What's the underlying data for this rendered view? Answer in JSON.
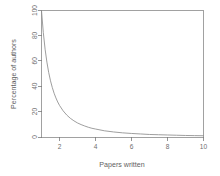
{
  "chart_data": {
    "type": "line",
    "title": "",
    "xlabel": "Papers written",
    "ylabel": "Percentage of authors",
    "xlim": [
      1,
      10
    ],
    "ylim": [
      0,
      100
    ],
    "xticks": [
      2,
      4,
      6,
      8,
      10
    ],
    "xtick_labels": [
      "2",
      "4",
      "6",
      "8",
      "10"
    ],
    "yticks": [
      0,
      20,
      40,
      60,
      80,
      100
    ],
    "ytick_labels": [
      "0",
      "20",
      "40",
      "60",
      "80",
      "100"
    ],
    "grid": false,
    "legend": false,
    "legend_position": "none",
    "frame": "box",
    "series": [
      {
        "name": "Lotka distribution",
        "x": [
          1.0,
          1.1,
          1.2,
          1.3,
          1.4,
          1.5,
          1.6,
          1.7,
          1.8,
          1.9,
          2.0,
          2.2,
          2.4,
          2.6,
          2.8,
          3.0,
          3.2,
          3.4,
          3.6,
          3.8,
          4.0,
          4.5,
          5.0,
          5.5,
          6.0,
          6.5,
          7.0,
          7.5,
          8.0,
          8.5,
          9.0,
          9.5,
          10.0
        ],
        "values": [
          100.0,
          82.6,
          69.4,
          59.2,
          51.0,
          44.4,
          39.1,
          34.6,
          30.9,
          27.7,
          25.0,
          20.7,
          17.4,
          14.8,
          12.8,
          11.1,
          9.8,
          8.7,
          7.7,
          6.9,
          6.3,
          4.9,
          4.0,
          3.3,
          2.8,
          2.4,
          2.0,
          1.8,
          1.6,
          1.4,
          1.2,
          1.1,
          1.0
        ]
      }
    ],
    "curve_equation": "y = 100 / x^2",
    "colors": {
      "curve": "#8c8c8c",
      "axis": "#7a7a7a",
      "frame": "#8a8a8a",
      "text": "#6f6f6f",
      "background": "#ffffff"
    }
  }
}
